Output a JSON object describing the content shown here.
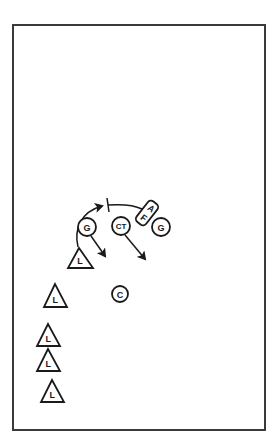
{
  "diagram": {
    "type": "sports-play-diagram",
    "frame": {
      "x": 13,
      "y": 25,
      "width": 252,
      "height": 405,
      "stroke": "#3a3a3a"
    },
    "colors": {
      "ink": "#1a1a1a",
      "background": "#ffffff"
    },
    "players": [
      {
        "id": "g-left",
        "shape": "circle",
        "label": "G",
        "cx": 87,
        "cy": 227,
        "r": 9
      },
      {
        "id": "ct",
        "shape": "circle",
        "label": "CT",
        "cx": 121,
        "cy": 226,
        "r": 9
      },
      {
        "id": "g-right",
        "shape": "circle",
        "label": "G",
        "cx": 161,
        "cy": 227,
        "r": 9
      },
      {
        "id": "c",
        "shape": "circle",
        "label": "C",
        "cx": 120,
        "cy": 294,
        "r": 8
      }
    ],
    "af_box": {
      "label_top": "A",
      "label_bottom": "F",
      "cx": 147,
      "cy": 213,
      "w": 26,
      "h": 12,
      "rotate": -52
    },
    "triangles": [
      {
        "id": "l-1",
        "label": "L",
        "apex": [
          79,
          248
        ],
        "left": [
          68,
          268
        ],
        "right": [
          93,
          268
        ]
      },
      {
        "id": "l-2",
        "label": "L",
        "apex": [
          55,
          284
        ],
        "left": [
          44,
          307
        ],
        "right": [
          67,
          307
        ]
      },
      {
        "id": "l-3",
        "label": "L",
        "apex": [
          48,
          324
        ],
        "left": [
          37,
          346
        ],
        "right": [
          60,
          346
        ]
      },
      {
        "id": "l-4",
        "label": "L",
        "apex": [
          48,
          349
        ],
        "left": [
          37,
          371
        ],
        "right": [
          60,
          371
        ]
      },
      {
        "id": "l-5",
        "label": "L",
        "apex": [
          52,
          380
        ],
        "left": [
          41,
          402
        ],
        "right": [
          64,
          402
        ]
      }
    ],
    "arrows": [
      {
        "id": "l1-curve-arrow",
        "path": "M78,247 C74,230 80,212 102,206"
      },
      {
        "id": "g-left-arrow",
        "path": "M91,236 L105,256"
      },
      {
        "id": "ct-arrow",
        "path": "M125,235 L145,259"
      }
    ],
    "lines": [
      {
        "id": "af-block-line",
        "path": "M108,205 C122,204 134,205 142,209"
      }
    ],
    "block_tick": {
      "x1": 107,
      "y1": 198,
      "x2": 109,
      "y2": 212
    }
  }
}
